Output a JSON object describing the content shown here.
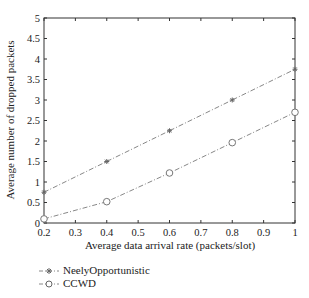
{
  "chart_data": {
    "type": "line",
    "title": "",
    "xlabel": "Average data arrival rate (packets/slot)",
    "ylabel": "Average number of dropped packets",
    "xlim": [
      0.2,
      1.0
    ],
    "ylim": [
      0,
      5
    ],
    "x_ticks": [
      "0.2",
      "0.3",
      "0.4",
      "0.5",
      "0.6",
      "0.7",
      "0.8",
      "0.9",
      "1"
    ],
    "y_ticks": [
      "0",
      "0.5",
      "1",
      "1.5",
      "2",
      "2.5",
      "3",
      "3.5",
      "4",
      "4.5",
      "5"
    ],
    "grid": false,
    "legend_position": "below",
    "x": [
      0.2,
      0.4,
      0.6,
      0.8,
      1.0
    ],
    "series": [
      {
        "name": "NeelyOpportunistic",
        "marker": "asterisk",
        "linestyle": "dash-dot",
        "color": "#888888",
        "values": [
          0.75,
          1.5,
          2.25,
          3.0,
          3.75
        ]
      },
      {
        "name": "CCWD",
        "marker": "circle",
        "linestyle": "dash-dot",
        "color": "#888888",
        "values": [
          0.1,
          0.52,
          1.22,
          1.96,
          2.7
        ]
      }
    ]
  },
  "legend": {
    "items": [
      {
        "label": "NeelyOpportunistic",
        "marker": "asterisk"
      },
      {
        "label": "CCWD",
        "marker": "circle"
      }
    ]
  }
}
